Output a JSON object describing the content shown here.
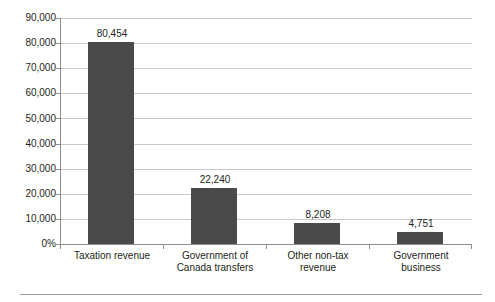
{
  "chart_data": {
    "type": "bar",
    "title": "",
    "subtitle": "",
    "xlabel": "",
    "ylabel": "",
    "categories": [
      "Taxation revenue",
      "Government of Canada transfers",
      "Other non-tax revenue",
      "Government business"
    ],
    "values": [
      80454,
      22240,
      8208,
      4751
    ],
    "value_labels": [
      "80,454",
      "22,240",
      "8,208",
      "4,751"
    ],
    "ylim": [
      0,
      90000
    ],
    "ytick_values": [
      90000,
      80000,
      70000,
      60000,
      50000,
      40000,
      30000,
      20000,
      10000,
      0
    ],
    "ytick_labels": [
      "90,000",
      "80,000",
      "70,000",
      "60,000",
      "50,000",
      "40,000",
      "30,000",
      "20,000",
      "10,000",
      "0%"
    ],
    "grid": true,
    "grid_axis": "y",
    "legend": false,
    "legend_position": "none",
    "bar_color": "#4a4a4a",
    "gridline_color": "#c9c9c9",
    "axis_color": "#8d8d8d",
    "background_color": "#ffffff",
    "annotations": []
  },
  "category_label_lines": [
    [
      "Taxation revenue"
    ],
    [
      "Government of",
      "Canada transfers"
    ],
    [
      "Other non-tax",
      "revenue"
    ],
    [
      "Government",
      "business"
    ]
  ]
}
